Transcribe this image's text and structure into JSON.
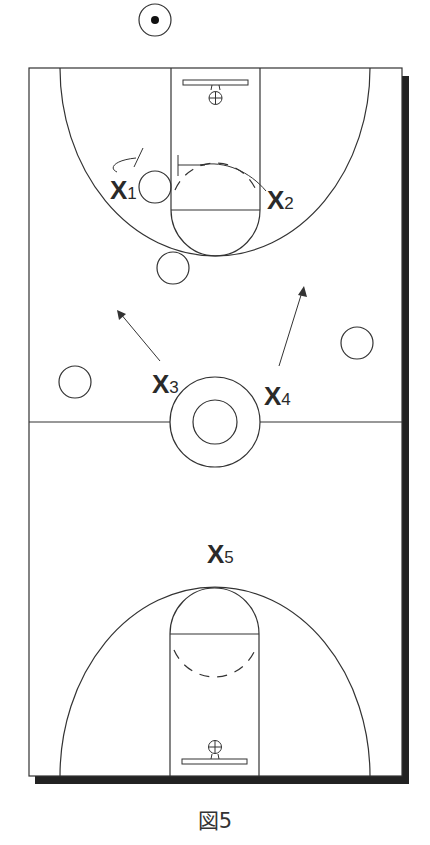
{
  "figure": {
    "caption": "図5"
  },
  "colors": {
    "line": "#333333",
    "shadow": "#222222",
    "background": "#ffffff"
  },
  "defenders": [
    {
      "id": "X1",
      "letter": "X",
      "number": "1"
    },
    {
      "id": "X2",
      "letter": "X",
      "number": "2"
    },
    {
      "id": "X3",
      "letter": "X",
      "number": "3"
    },
    {
      "id": "X4",
      "letter": "X",
      "number": "4"
    },
    {
      "id": "X5",
      "letter": "X",
      "number": "5"
    }
  ],
  "offense": {
    "ball_handler": "offensive-player-with-ball",
    "players": [
      "offense-left-baseline-wing",
      "offense-top-of-key",
      "offense-left-wing",
      "offense-right-wing",
      "offense-ball-inbounder"
    ]
  },
  "movements": [
    {
      "from": "X3",
      "direction": "up-left"
    },
    {
      "from": "X4",
      "direction": "up-right"
    },
    {
      "from": "X2",
      "direction": "cut-over-screen"
    }
  ]
}
